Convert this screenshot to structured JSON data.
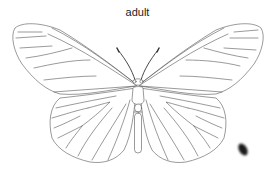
{
  "diagram": {
    "title": "adult",
    "style": "line-drawing",
    "parts": [
      "forewing-left",
      "forewing-right",
      "hindwing-left",
      "hindwing-right",
      "antennae",
      "head",
      "thorax",
      "abdomen"
    ],
    "colors": {
      "line": "#555555",
      "background": "#ffffff",
      "smudge": "#1a1a1a"
    }
  }
}
